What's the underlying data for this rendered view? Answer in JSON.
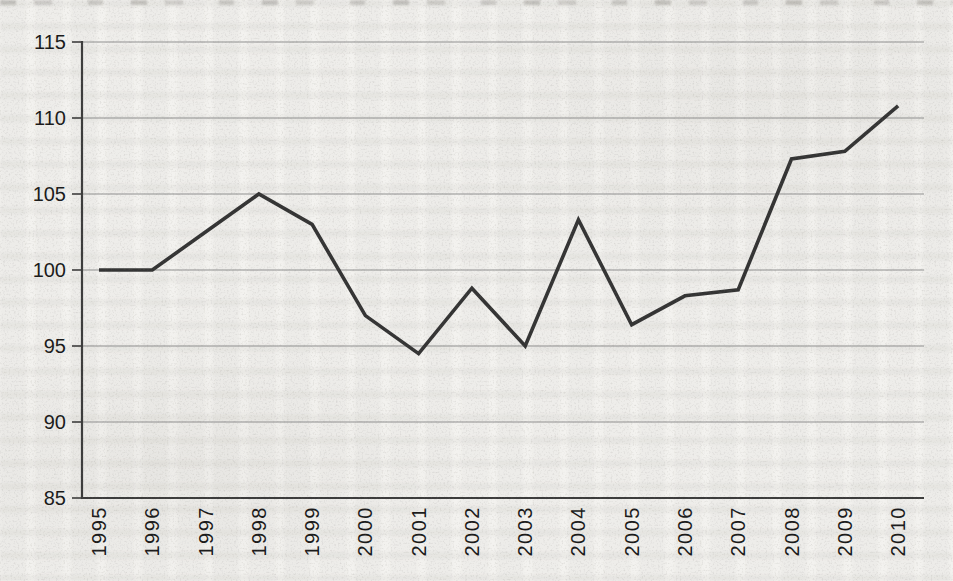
{
  "chart_data": {
    "type": "line",
    "title": "",
    "xlabel": "",
    "ylabel": "",
    "categories": [
      "1995",
      "1996",
      "1997",
      "1998",
      "1999",
      "2000",
      "2001",
      "2002",
      "2003",
      "2004",
      "2005",
      "2006",
      "2007",
      "2008",
      "2009",
      "2010"
    ],
    "series": [
      {
        "name": "",
        "values": [
          100.0,
          100.0,
          102.5,
          105.0,
          103.0,
          97.0,
          94.5,
          98.8,
          95.0,
          103.3,
          96.4,
          98.3,
          98.7,
          107.3,
          107.8,
          110.8
        ]
      }
    ],
    "ylim": [
      85,
      115
    ],
    "yticks": [
      85,
      90,
      95,
      100,
      105,
      110,
      115
    ],
    "grid": "horizontal",
    "legend": "none",
    "x_tick_rotation": 90
  },
  "colors": {
    "paper": "#f3f2ef",
    "series_line": "#343434",
    "gridline": "#8f8f8f",
    "axis": "#3c3c3c",
    "tick_label": "#1a1a1a"
  }
}
